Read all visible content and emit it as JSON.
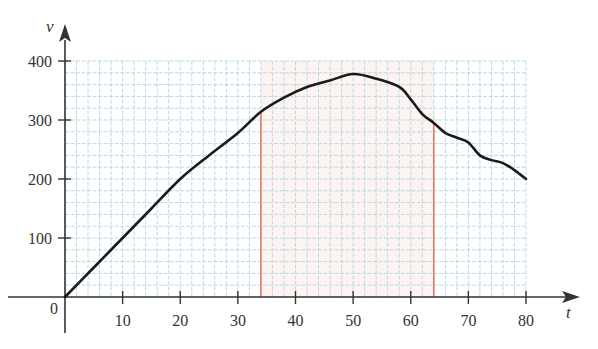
{
  "chart_data": {
    "type": "line",
    "title": "",
    "xlabel": "t",
    "ylabel": "v",
    "xlim": [
      0,
      80
    ],
    "ylim": [
      0,
      400
    ],
    "grid": true,
    "x_ticks": [
      10,
      20,
      30,
      40,
      50,
      60,
      70,
      80
    ],
    "y_ticks": [
      100,
      200,
      300,
      400
    ],
    "origin_label": "0",
    "series": [
      {
        "name": "v(t)",
        "x": [
          0,
          5,
          10,
          15,
          20,
          25,
          30,
          34,
          38,
          42,
          46,
          50,
          54,
          58,
          60,
          62,
          64,
          66,
          68,
          70,
          72,
          74,
          76,
          78,
          80
        ],
        "values": [
          0,
          50,
          100,
          150,
          200,
          240,
          278,
          314,
          338,
          356,
          367,
          378,
          370,
          356,
          335,
          310,
          295,
          278,
          270,
          262,
          240,
          232,
          227,
          215,
          200
        ]
      }
    ],
    "annotations": [
      {
        "type": "vertical-line",
        "x": 34,
        "color": "#e0604a"
      },
      {
        "type": "vertical-line",
        "x": 64,
        "color": "#e0604a"
      },
      {
        "type": "shaded-region",
        "x_from": 34,
        "x_to": 64,
        "color": "#fdf3f0"
      }
    ]
  },
  "colors": {
    "grid": "#b9dbe8",
    "axis": "#333333",
    "curve": "#1a1a1a",
    "marker_line": "#e0604a"
  }
}
